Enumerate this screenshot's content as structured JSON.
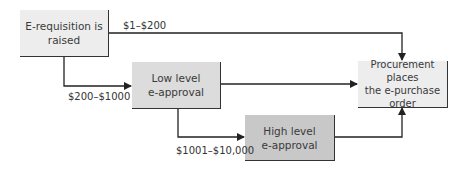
{
  "nodes": {
    "start": {
      "text_line1": "E-requisition is",
      "text_line2": "raised"
    },
    "low": {
      "text_line1": "Low level",
      "text_line2": "e-approval"
    },
    "high": {
      "text_line1": "High level",
      "text_line2": "e-approval"
    },
    "end": {
      "text_line1": "Procurement places",
      "text_line2": "the e-purchase",
      "text_line3": "order"
    }
  },
  "edges": {
    "small": {
      "label": "$1–$200"
    },
    "medium": {
      "label": "$200–$1000"
    },
    "large": {
      "label": "$1001–$10,000"
    }
  },
  "colors": {
    "start_fill": "#ededed",
    "low_fill": "#dcdcdc",
    "high_fill": "#c8c8c8",
    "end_fill": "#ededed",
    "line": "#222222"
  }
}
